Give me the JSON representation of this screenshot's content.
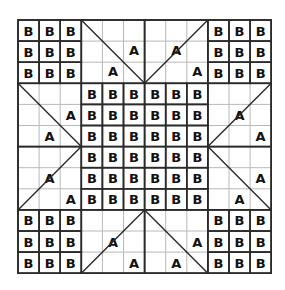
{
  "diagram": {
    "grid_cells": 12,
    "origin": [
      18,
      20
    ],
    "cell_size": 21.1,
    "colors": {
      "thin_line": "#b8b8b8",
      "thick_line": "#2a2a2a",
      "text": "#111111",
      "background": "#ffffff"
    },
    "b_label": "B",
    "a_label": "A",
    "b_blocks": [
      {
        "name": "top-left-corner",
        "col": 0,
        "row": 0,
        "w": 3,
        "h": 3
      },
      {
        "name": "top-right-corner",
        "col": 9,
        "row": 0,
        "w": 3,
        "h": 3
      },
      {
        "name": "bottom-left-corner",
        "col": 0,
        "row": 9,
        "w": 3,
        "h": 3
      },
      {
        "name": "bottom-right-corner",
        "col": 9,
        "row": 9,
        "w": 3,
        "h": 3
      },
      {
        "name": "center",
        "col": 3,
        "row": 3,
        "w": 6,
        "h": 6
      }
    ],
    "triangle_blocks": [
      {
        "name": "top-left-triangle",
        "col": 3,
        "row": 0,
        "diag": [
          [
            3,
            0
          ],
          [
            6,
            3
          ]
        ],
        "a_labels": [
          [
            5.0,
            0.9
          ],
          [
            4.0,
            1.9
          ]
        ]
      },
      {
        "name": "top-right-triangle",
        "col": 6,
        "row": 0,
        "diag": [
          [
            6,
            3
          ],
          [
            9,
            0
          ]
        ],
        "a_labels": [
          [
            7.0,
            0.9
          ],
          [
            8.0,
            1.9
          ]
        ]
      },
      {
        "name": "left-top-triangle",
        "col": 0,
        "row": 3,
        "diag": [
          [
            0,
            3
          ],
          [
            3,
            6
          ]
        ],
        "a_labels": [
          [
            2.0,
            4.0
          ],
          [
            1.0,
            5.0
          ]
        ]
      },
      {
        "name": "left-bottom-triangle",
        "col": 0,
        "row": 6,
        "diag": [
          [
            0,
            9
          ],
          [
            3,
            6
          ]
        ],
        "a_labels": [
          [
            1.0,
            7.0
          ],
          [
            2.0,
            8.0
          ]
        ]
      },
      {
        "name": "right-top-triangle",
        "col": 9,
        "row": 3,
        "diag": [
          [
            9,
            6
          ],
          [
            12,
            3
          ]
        ],
        "a_labels": [
          [
            10.0,
            4.0
          ],
          [
            11.0,
            5.0
          ]
        ]
      },
      {
        "name": "right-bottom-triangle",
        "col": 9,
        "row": 6,
        "diag": [
          [
            9,
            6
          ],
          [
            12,
            9
          ]
        ],
        "a_labels": [
          [
            11.0,
            7.0
          ],
          [
            10.0,
            8.0
          ]
        ]
      },
      {
        "name": "bottom-left-triangle",
        "col": 3,
        "row": 9,
        "diag": [
          [
            3,
            12
          ],
          [
            6,
            9
          ]
        ],
        "a_labels": [
          [
            4.0,
            10.0
          ],
          [
            5.0,
            11.0
          ]
        ]
      },
      {
        "name": "bottom-right-triangle",
        "col": 6,
        "row": 9,
        "diag": [
          [
            6,
            9
          ],
          [
            9,
            12
          ]
        ],
        "a_labels": [
          [
            8.0,
            10.0
          ],
          [
            7.0,
            11.0
          ]
        ]
      }
    ]
  }
}
